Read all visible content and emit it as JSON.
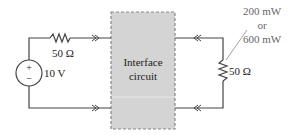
{
  "diagram": {
    "type": "circuit",
    "source": {
      "type": "voltage-source",
      "label": "10 V",
      "plus_sign": "+",
      "minus_sign": "−"
    },
    "source_resistor": {
      "label": "50 Ω"
    },
    "interface_block": {
      "line1": "Interface",
      "line2": "circuit",
      "fill_color": "#d4d4d4",
      "border_style": "dashed"
    },
    "load_resistor": {
      "label": "50 Ω"
    },
    "power_annotation": {
      "line1": "200 mW",
      "line2": "or",
      "line3": "600 mW"
    },
    "colors": {
      "wire": "#444444",
      "text": "#222222",
      "annotation": "#666666",
      "box_fill": "#d4d4d4",
      "box_border": "#888888"
    }
  }
}
